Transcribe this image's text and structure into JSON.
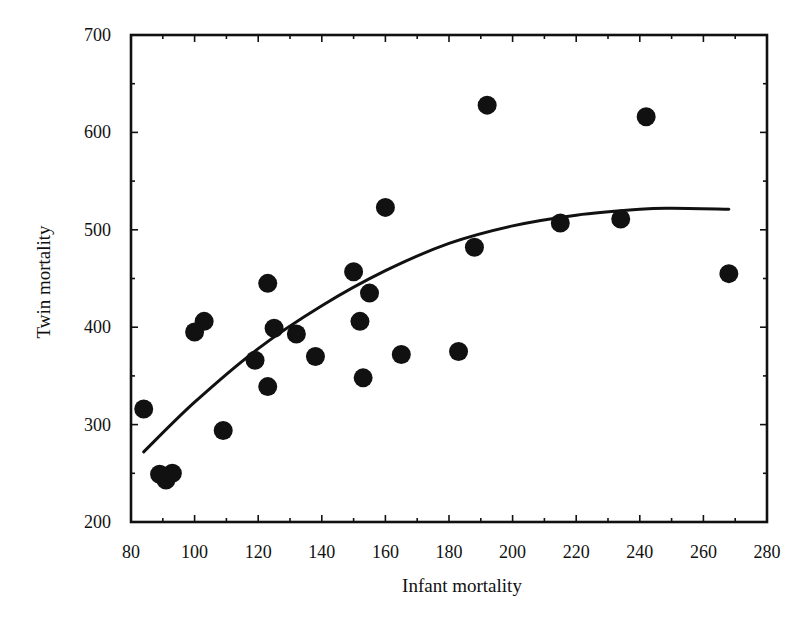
{
  "chart_data": {
    "type": "scatter",
    "title": "",
    "xlabel": "Infant mortality",
    "ylabel": "Twin mortality",
    "xlim": [
      80,
      280
    ],
    "ylim": [
      200,
      700
    ],
    "xticks": [
      80,
      100,
      120,
      140,
      160,
      180,
      200,
      220,
      240,
      260,
      280
    ],
    "yticks": [
      200,
      300,
      400,
      500,
      600,
      700
    ],
    "x_minor_step": 10,
    "y_minor_step": 50,
    "grid": false,
    "legend": null,
    "series": [
      {
        "name": "Observations",
        "marker": "filled-circle",
        "color": "#111111",
        "points": [
          [
            84,
            316
          ],
          [
            89,
            249
          ],
          [
            91,
            243
          ],
          [
            93,
            250
          ],
          [
            100,
            395
          ],
          [
            103,
            406
          ],
          [
            109,
            294
          ],
          [
            119,
            366
          ],
          [
            123,
            445
          ],
          [
            123,
            339
          ],
          [
            125,
            399
          ],
          [
            132,
            393
          ],
          [
            138,
            370
          ],
          [
            150,
            457
          ],
          [
            152,
            406
          ],
          [
            153,
            348
          ],
          [
            155,
            435
          ],
          [
            160,
            523
          ],
          [
            165,
            372
          ],
          [
            183,
            375
          ],
          [
            188,
            482
          ],
          [
            192,
            628
          ],
          [
            215,
            507
          ],
          [
            234,
            511
          ],
          [
            242,
            616
          ],
          [
            268,
            455
          ]
        ]
      },
      {
        "name": "Quadratic fit",
        "type": "line",
        "color": "#111111",
        "points": [
          [
            84,
            272
          ],
          [
            100,
            323
          ],
          [
            120,
            378
          ],
          [
            140,
            422
          ],
          [
            160,
            458
          ],
          [
            180,
            486
          ],
          [
            200,
            504
          ],
          [
            220,
            515
          ],
          [
            240,
            521
          ],
          [
            250,
            522
          ],
          [
            268,
            521
          ]
        ]
      }
    ]
  },
  "axes": {
    "x_title": "Infant mortality",
    "y_title": "Twin mortality"
  }
}
